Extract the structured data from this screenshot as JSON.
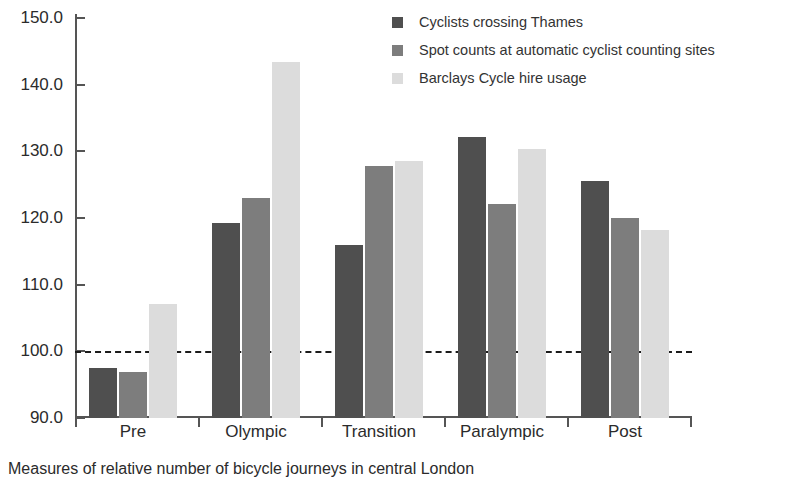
{
  "caption": "Measures of relative number of bicycle journeys in central London",
  "legend": {
    "items": [
      {
        "label": "Cyclists crossing Thames",
        "color": "#4f4f4f"
      },
      {
        "label": "Spot counts at automatic cyclist counting sites",
        "color": "#7d7d7d"
      },
      {
        "label": "Barclays Cycle hire usage",
        "color": "#dcdcdc"
      }
    ]
  },
  "axes": {
    "y_ticks": [
      "150.0",
      "140.0",
      "130.0",
      "120.0",
      "110.0",
      "100.0",
      "90.0"
    ],
    "x_ticks": [
      "Pre",
      "Olympic",
      "Transition",
      "Paralympic",
      "Post"
    ]
  },
  "reference_line": {
    "value": 100,
    "style": "dashed",
    "color": "#1b1b1b"
  },
  "chart_data": {
    "type": "bar",
    "title": "",
    "subtitle": "",
    "xlabel": "",
    "ylabel": "",
    "caption": "Measures of relative number of bicycle journeys in central London",
    "categories": [
      "Pre",
      "Olympic",
      "Transition",
      "Paralympic",
      "Post"
    ],
    "series": [
      {
        "name": "Cyclists crossing Thames",
        "color": "#4f4f4f",
        "values": [
          97.5,
          119.2,
          116.0,
          132.2,
          125.5
        ]
      },
      {
        "name": "Spot counts at automatic cyclist counting sites",
        "color": "#7d7d7d",
        "values": [
          96.9,
          123.0,
          127.8,
          122.1,
          120.0
        ]
      },
      {
        "name": "Barclays Cycle hire usage",
        "color": "#dcdcdc",
        "values": [
          107.1,
          143.4,
          128.5,
          130.3,
          118.2
        ]
      }
    ],
    "ylim": [
      90,
      150
    ],
    "ytick_step": 10,
    "grid": false,
    "legend_position": "top-right",
    "reference_line": 100
  }
}
